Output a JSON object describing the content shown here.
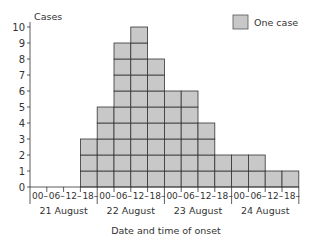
{
  "chart_data": {
    "type": "bar",
    "title": "",
    "xlabel": "Date and time of onset",
    "ylabel": "Cases",
    "ylim": [
      0,
      10
    ],
    "yticks": [
      0,
      1,
      2,
      3,
      4,
      5,
      6,
      7,
      8,
      9,
      10
    ],
    "grid": false,
    "legend": {
      "position": "top-right",
      "entries": [
        "One case"
      ]
    },
    "bar_color": "#c8c8c8",
    "edge_color": "#333333",
    "categories": [
      "21 Aug 00",
      "21 Aug 06",
      "21 Aug 12",
      "21 Aug 18",
      "22 Aug 00",
      "22 Aug 06",
      "22 Aug 12",
      "22 Aug 18",
      "23 Aug 00",
      "23 Aug 06",
      "23 Aug 12",
      "23 Aug 18",
      "24 Aug 00",
      "24 Aug 06",
      "24 Aug 12",
      "24 Aug 18"
    ],
    "tick_labels": [
      "00–",
      "06–",
      "12–",
      "18–",
      "00–",
      "06–",
      "12–",
      "18–",
      "00–",
      "06–",
      "12–",
      "18–",
      "00–",
      "06–",
      "12–",
      "18–"
    ],
    "day_labels": [
      "21 August",
      "22 August",
      "23 August",
      "24 August"
    ],
    "values": [
      0,
      0,
      0,
      3,
      5,
      9,
      10,
      8,
      6,
      6,
      4,
      2,
      2,
      2,
      1,
      1
    ]
  }
}
